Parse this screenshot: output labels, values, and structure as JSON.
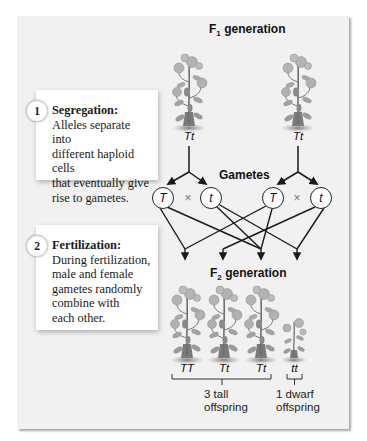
{
  "headings": {
    "f1": {
      "prefix": "F",
      "sub": "1",
      "suffix": " generation"
    },
    "gametes": "Gametes",
    "f2": {
      "prefix": "F",
      "sub": "2",
      "suffix": " generation"
    }
  },
  "f1_plants": [
    {
      "genotype": "Tt"
    },
    {
      "genotype": "Tt"
    }
  ],
  "gametes": {
    "left": [
      "T",
      "t"
    ],
    "right": [
      "T",
      "t"
    ],
    "cross_symbol": "×"
  },
  "notes": [
    {
      "number": "1",
      "title": "Segregation:",
      "lines": [
        "Alleles separate into",
        "different haploid cells",
        "that eventually give",
        "rise to gametes."
      ]
    },
    {
      "number": "2",
      "title": "Fertilization:",
      "lines": [
        "During fertilization,",
        "male and female",
        "gametes randomly",
        "combine with",
        "each other."
      ]
    }
  ],
  "f2_plants": [
    {
      "genotype": "TT",
      "phenotype": "tall"
    },
    {
      "genotype": "Tt",
      "phenotype": "tall"
    },
    {
      "genotype": "Tt",
      "phenotype": "tall"
    },
    {
      "genotype": "tt",
      "phenotype": "dwarf"
    }
  ],
  "captions": {
    "tall": [
      "3 tall",
      "offspring"
    ],
    "dwarf": [
      "1 dwarf",
      "offspring"
    ]
  },
  "colors": {
    "panel_bg": "#f1f1f1",
    "line": "#1a1a1a",
    "plant_leaf": "#9a9a9a",
    "plant_dark": "#6e6e6e"
  }
}
